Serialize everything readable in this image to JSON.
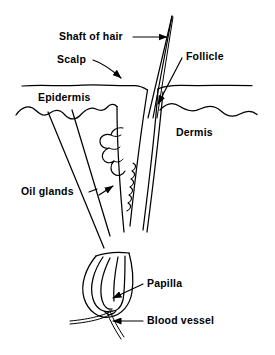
{
  "diagram": {
    "type": "anatomical-line-drawing",
    "background_color": "#ffffff",
    "stroke_color": "#000000",
    "labels": [
      {
        "id": "shaft-of-hair",
        "text": "Shaft of hair",
        "leader": "horizontal-line-with-arrow",
        "points_to": "hair shaft above scalp"
      },
      {
        "id": "scalp",
        "text": "Scalp",
        "leader": "diagonal-line-with-arrow",
        "points_to": "skin surface line"
      },
      {
        "id": "follicle",
        "text": "Follicle",
        "leader": "diagonal-line-with-arrow",
        "points_to": "follicle canal below surface"
      },
      {
        "id": "epidermis",
        "text": "Epidermis",
        "leader": "none",
        "points_to": "upper skin layer"
      },
      {
        "id": "dermis",
        "text": "Dermis",
        "leader": "none",
        "points_to": "lower skin layer"
      },
      {
        "id": "oil-glands",
        "text": "Oil glands",
        "leader": "dash-and-line-with-arrow",
        "points_to": "lobed sebaceous gland cluster"
      },
      {
        "id": "papilla",
        "text": "Papilla",
        "leader": "diagonal-line-with-arrow",
        "points_to": "base of hair bulb"
      },
      {
        "id": "blood-vessel",
        "text": "Blood vessel",
        "leader": "horizontal-line-with-arrow",
        "points_to": "vessel strands under bulb"
      }
    ],
    "structures": [
      "hair shaft",
      "scalp surface line",
      "epidermis wavy boundary",
      "dermis region",
      "follicle canal walls",
      "sebaceous oil glands",
      "hair bulb",
      "dermal papilla",
      "blood vessels"
    ]
  }
}
